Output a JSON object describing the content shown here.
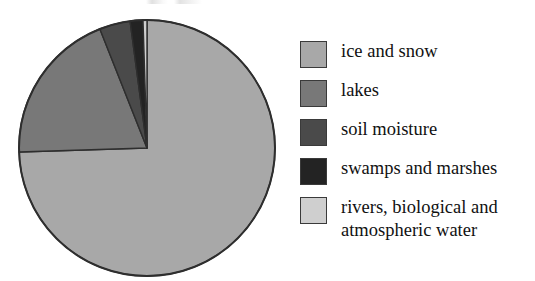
{
  "chart_data": {
    "type": "pie",
    "title": "",
    "xlabel": "",
    "ylabel": "",
    "legend_position": "right",
    "grid": false,
    "start_angle_deg": 0,
    "direction": "clockwise",
    "categories": [
      "ice and snow",
      "lakes",
      "soil moisture",
      "swamps and marshes",
      "rivers, biological and atmospheric water"
    ],
    "values": [
      74.5,
      19.5,
      3.9,
      1.6,
      0.5
    ],
    "units": "percent",
    "colors": [
      "#a8a8a8",
      "#787878",
      "#4a4a4a",
      "#232323",
      "#cfcfcf"
    ],
    "slices": [
      {
        "label": "ice and snow",
        "value": 74.5,
        "color": "#a8a8a8",
        "start_deg": 0,
        "end_deg": 268.2
      },
      {
        "label": "lakes",
        "value": 19.5,
        "color": "#787878",
        "start_deg": 268.2,
        "end_deg": 338.4
      },
      {
        "label": "soil moisture",
        "value": 3.9,
        "color": "#4a4a4a",
        "start_deg": 338.4,
        "end_deg": 352.4
      },
      {
        "label": "swamps and marshes",
        "value": 1.6,
        "color": "#232323",
        "start_deg": 352.4,
        "end_deg": 358.2
      },
      {
        "label": "rivers, biological and atmospheric water",
        "value": 0.5,
        "color": "#cfcfcf",
        "start_deg": 358.2,
        "end_deg": 360
      }
    ],
    "geometry": {
      "center_x": 139,
      "center_y": 142,
      "radius": 128,
      "outline_color": "#2e2e2e"
    }
  },
  "legend": {
    "items": [
      {
        "label": "ice and snow",
        "color": "#a8a8a8"
      },
      {
        "label": "lakes",
        "color": "#787878"
      },
      {
        "label": "soil moisture",
        "color": "#4a4a4a"
      },
      {
        "label": "swamps and marshes",
        "color": "#232323"
      },
      {
        "label": "rivers, biological and\natmospheric water",
        "color": "#cfcfcf"
      }
    ]
  }
}
